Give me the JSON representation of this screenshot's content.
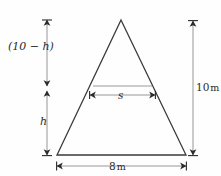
{
  "figure": {
    "kind": "geometry-diagram",
    "colors": {
      "background": "#fefefe",
      "outline": "#3a3a3a",
      "chord": "#9a9a9a",
      "dimension_line": "#8c8c8c",
      "arrow": "#2b2b2b",
      "text": "#2b2b2b"
    },
    "shape": {
      "name": "triangle",
      "apex": {
        "x": 121,
        "y": 20
      },
      "bottom_left": {
        "x": 57,
        "y": 155
      },
      "bottom_right": {
        "x": 186,
        "y": 155
      }
    },
    "chord": {
      "name": "inner-horizontal-chord",
      "y": 86,
      "x_start": 93,
      "x_end": 152
    },
    "labels": {
      "upper_left": "(10 − h)",
      "lower_left": "h",
      "right": "10",
      "right_unit": "m",
      "bottom": "8",
      "bottom_unit": "m",
      "chord": "s"
    },
    "dimensions": {
      "left_upper": {
        "name": "upper-height-dimension",
        "label": "(10 − h)",
        "x": 47,
        "y_top": 20,
        "y_bottom": 86
      },
      "left_lower": {
        "name": "lower-height-dimension",
        "label": "h",
        "x": 47,
        "y_top": 91,
        "y_bottom": 155
      },
      "right_total": {
        "name": "total-height-dimension",
        "label": "10 m",
        "x": 193,
        "y_top": 21,
        "y_bottom": 155
      },
      "bottom_base": {
        "name": "base-width-dimension",
        "label": "8 m",
        "y": 166,
        "x_start": 57,
        "x_end": 186
      },
      "chord_span": {
        "name": "chord-width-dimension",
        "label": "s",
        "y": 95,
        "x_start": 90,
        "x_end": 155
      }
    }
  }
}
